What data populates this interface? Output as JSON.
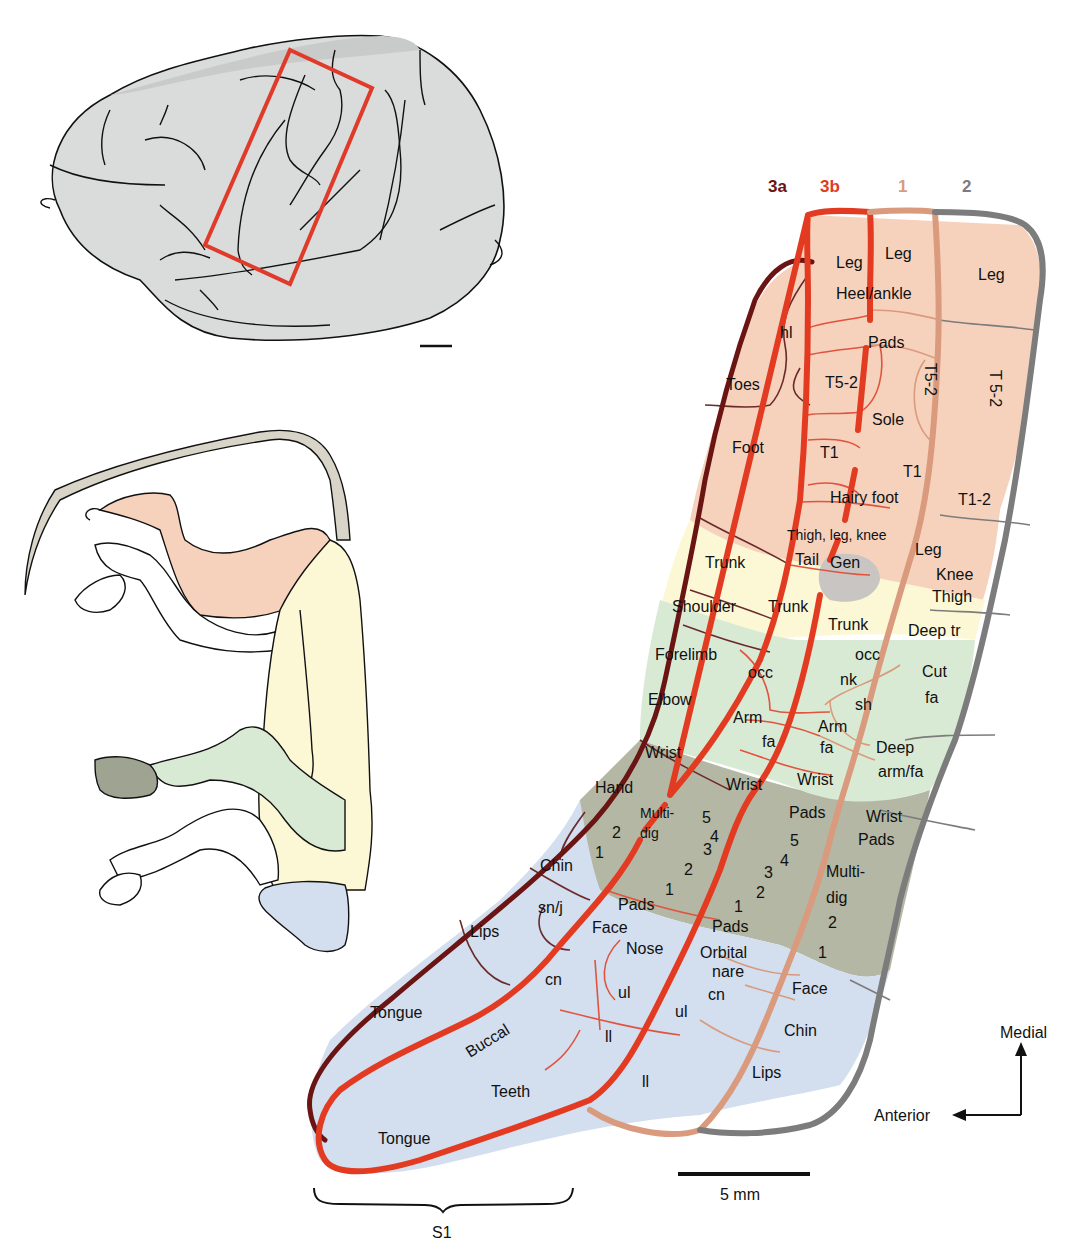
{
  "figure": {
    "colors": {
      "area_3a": "#6b1414",
      "area_3b": "#e23b22",
      "area_1": "#d99a7d",
      "area_2": "#7c7c7c",
      "hindlimb_fill": "#f6d2bd",
      "trunk_fill": "#fcf8d6",
      "forelimb_fill": "#d9ead4",
      "hand_fill": "#b3b7a3",
      "face_fill": "#d3deee",
      "tail_fill": "#d8d4c8",
      "genital_fill": "#c9c5c2",
      "brain_fill": "#d9dcda",
      "brain_box": "#e03a2a"
    },
    "area_headers": [
      {
        "label": "3a",
        "color": "#6b1414"
      },
      {
        "label": "3b",
        "color": "#e23b22"
      },
      {
        "label": "1",
        "color": "#d99a7d"
      },
      {
        "label": "2",
        "color": "#7c7c7c"
      }
    ],
    "map_labels": {
      "leg_3b": "Leg",
      "leg_1": "Leg",
      "leg_2": "Leg",
      "heel_ankle": "Heel/ankle",
      "hl": "hl",
      "pads_foot": "Pads",
      "toes": "Toes",
      "t52_3b": "T5-2",
      "t52_1": "T5-2",
      "t52_2": "T 5-2",
      "sole": "Sole",
      "foot": "Foot",
      "t1_3b": "T1",
      "t1_1": "T1",
      "t12_2": "T1-2",
      "hairy_foot": "Hairy foot",
      "thigh_leg_knee": "Thigh, leg, knee",
      "trunk_3a": "Trunk",
      "tail": "Tail",
      "gen": "Gen",
      "leg_2b": "Leg",
      "knee": "Knee",
      "thigh": "Thigh",
      "shoulder": "Shoulder",
      "trunk_3b": "Trunk",
      "trunk_1": "Trunk",
      "deep_tr": "Deep tr",
      "forelimb": "Forelimb",
      "occ_3b": "occ",
      "occ_1": "occ",
      "nk": "nk",
      "sh": "sh",
      "cut": "Cut",
      "fa_2": "fa",
      "elbow": "Elbow",
      "arm_3b": "Arm",
      "fa_3b": "fa",
      "arm_1": "Arm",
      "fa_1": "fa",
      "deep": "Deep",
      "arm_fa": "arm/fa",
      "wrist_3a": "Wrist",
      "wrist_3b": "Wrist",
      "wrist_1": "Wrist",
      "wrist_2": "Wrist",
      "pads_2": "Pads",
      "hand": "Hand",
      "multi_3a": "Multi-",
      "dig_3a": "dig",
      "pads_1top": "Pads",
      "d2_3a": "2",
      "d1_3a": "1",
      "d5_3b": "5",
      "d4_3b": "4",
      "d3_3b": "3",
      "d2_3b": "2",
      "d1_3b": "1",
      "pads_3b": "Pads",
      "d5_1": "5",
      "d4_1": "4",
      "d3_1": "3",
      "d2_1": "2",
      "d1_1": "1",
      "pads_1": "Pads",
      "multi_2": "Multi-",
      "dig_2": "dig",
      "d2_2": "2",
      "d1_2": "1",
      "chin_3a": "Chin",
      "snj": "sn/j",
      "lips_3a": "Lips",
      "face_3b": "Face",
      "nose": "Nose",
      "orbital": "Orbital",
      "nare": "nare",
      "cn_3b": "cn",
      "ul_3b": "ul",
      "cn_1": "cn",
      "ul_1": "ul",
      "face_2": "Face",
      "chin_2": "Chin",
      "tongue_3a": "Tongue",
      "buccal": "Buccal",
      "ll_3b": "ll",
      "ll_1": "ll",
      "teeth": "Teeth",
      "lips_2": "Lips",
      "tongue_3b": "Tongue"
    },
    "scale_bar": {
      "label": "5 mm"
    },
    "orientation": {
      "medial": "Medial",
      "anterior": "Anterior"
    },
    "bracket": {
      "label": "S1"
    }
  }
}
